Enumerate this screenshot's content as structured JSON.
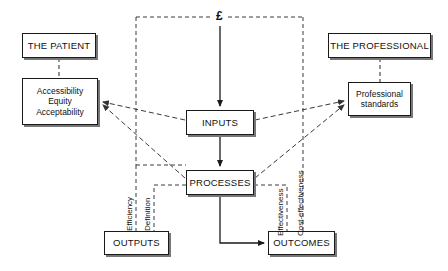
{
  "diagram": {
    "currency_symbol": "£",
    "nodes": [
      {
        "id": "the-patient",
        "label": "THE PATIENT",
        "x": 22,
        "y": 33,
        "w": 74,
        "h": 25,
        "style": "cap"
      },
      {
        "id": "accessibility",
        "label": "Accessibility\nEquity\nAcceptability",
        "x": 22,
        "y": 78,
        "w": 76,
        "h": 47,
        "style": "small"
      },
      {
        "id": "the-professional",
        "label": "THE PROFESSIONAL",
        "x": 328,
        "y": 33,
        "w": 103,
        "h": 25,
        "style": "cap"
      },
      {
        "id": "professional-standards",
        "label": "Professional\nstandards",
        "x": 348,
        "y": 82,
        "w": 63,
        "h": 34,
        "style": "small"
      },
      {
        "id": "inputs",
        "label": "INPUTS",
        "x": 186,
        "y": 110,
        "w": 68,
        "h": 25,
        "style": "cap"
      },
      {
        "id": "processes",
        "label": "PROCESSES",
        "x": 186,
        "y": 170,
        "w": 68,
        "h": 25,
        "style": "cap"
      },
      {
        "id": "outputs",
        "label": "OUTPUTS",
        "x": 104,
        "y": 231,
        "w": 65,
        "h": 24,
        "style": "cap"
      },
      {
        "id": "outcomes",
        "label": "OUTCOMES",
        "x": 268,
        "y": 231,
        "w": 67,
        "h": 24,
        "style": "cap"
      }
    ],
    "edge_labels": [
      {
        "id": "efficiency",
        "text": "Efficiency",
        "x": 134,
        "y": 222
      },
      {
        "id": "definition",
        "text": "Definition",
        "x": 152,
        "y": 222
      },
      {
        "id": "effectiveness",
        "text": "Effectiveness",
        "x": 285,
        "y": 225
      },
      {
        "id": "cost-effectiveness",
        "text": "Cost-effectiveness",
        "x": 306,
        "y": 225
      }
    ],
    "colors": {
      "line": "#1a1a1a",
      "dashed": "#3a3a3a",
      "box_fill": "#ffffff",
      "shadow": "#777777"
    }
  }
}
